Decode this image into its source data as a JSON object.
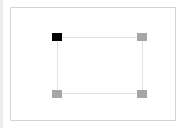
{
  "editor": {
    "colors": {
      "handle_selected": "#000000",
      "handle_default": "#a6a6a6",
      "frame_border": "#d4d4d4",
      "shape_border": "#e2e2e2"
    },
    "handles": [
      {
        "position": "top-left",
        "selected": true
      },
      {
        "position": "top-right",
        "selected": false
      },
      {
        "position": "bottom-left",
        "selected": false
      },
      {
        "position": "bottom-right",
        "selected": false
      }
    ]
  }
}
